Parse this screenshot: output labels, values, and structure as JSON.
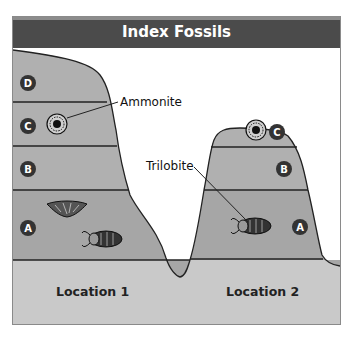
{
  "title": "Index Fossils",
  "labels": {
    "ammonite": "Ammonite",
    "trilobite": "Trilobite"
  },
  "locations": [
    {
      "name": "Location 1",
      "layers": [
        "D",
        "C",
        "B",
        "A"
      ],
      "fossils": {
        "C": [
          "ammonite"
        ],
        "A": [
          "brachiopod",
          "trilobite"
        ]
      }
    },
    {
      "name": "Location 2",
      "layers": [
        "C",
        "B",
        "A"
      ],
      "fossils": {
        "C": [
          "ammonite"
        ],
        "A": [
          "trilobite"
        ]
      }
    }
  ],
  "colors": {
    "header": "#4b4b4b",
    "layer_upper": "#adadad",
    "layer_lower": "#a2a2a2",
    "ground": "#c9c9c9",
    "badge": "#333333",
    "outline": "#222222"
  }
}
